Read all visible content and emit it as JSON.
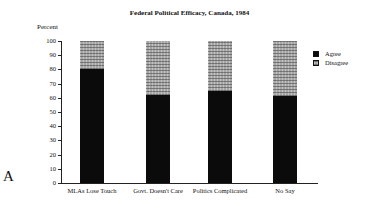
{
  "chart_data": {
    "type": "bar",
    "stacked": true,
    "title": "Federal Political Efficacy, Canada, 1984",
    "xlabel": "",
    "ylabel": "Percent",
    "ylim": [
      0,
      100
    ],
    "yticks": [
      0,
      10,
      20,
      30,
      40,
      50,
      60,
      70,
      80,
      90,
      100
    ],
    "grid": false,
    "legend_position": "right",
    "categories": [
      "MLAs Lose Touch",
      "Govt. Doesn't Care",
      "Politics Complicated",
      "No Say"
    ],
    "series": [
      {
        "name": "Agree",
        "values": [
          80,
          62,
          65,
          61
        ],
        "color": "#0b0b0b"
      },
      {
        "name": "Disagree",
        "values": [
          20,
          38,
          35,
          39
        ],
        "color": "#a5a5a5",
        "pattern": "crosshatch"
      }
    ]
  },
  "panel_letter": "A"
}
